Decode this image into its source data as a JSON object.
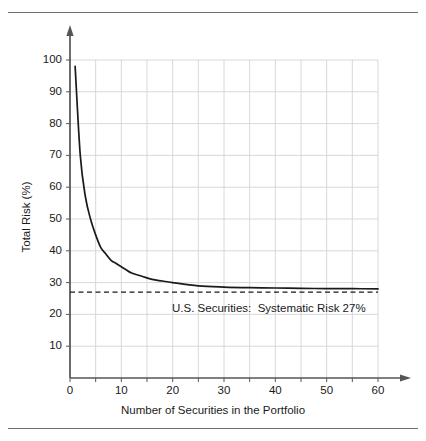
{
  "chart_data": {
    "type": "line",
    "title": "",
    "xlabel": "Number of Securities in the Portfolio",
    "ylabel": "Total Risk (%)",
    "xlim": [
      0,
      60
    ],
    "ylim": [
      0,
      100
    ],
    "xticks": [
      0,
      10,
      20,
      30,
      40,
      50,
      60
    ],
    "yticks": [
      10,
      20,
      30,
      40,
      50,
      60,
      70,
      80,
      90,
      100
    ],
    "grid": true,
    "grid_minor_step_x": 5,
    "grid_minor_step_y": 10,
    "legend": "none",
    "series": [
      {
        "name": "Total Risk",
        "x": [
          1,
          2,
          3,
          4,
          5,
          6,
          7,
          8,
          9,
          10,
          12,
          14,
          16,
          18,
          20,
          25,
          30,
          35,
          40,
          45,
          50,
          55,
          60
        ],
        "values": [
          98,
          70,
          57,
          50,
          45,
          41,
          39,
          37,
          36,
          35,
          33,
          32,
          31,
          30.5,
          30,
          29,
          28.6,
          28.4,
          28.3,
          28.2,
          28.1,
          28.1,
          28
        ]
      }
    ],
    "reference_line": {
      "name": "Systematic Risk",
      "value": 27,
      "style": "dashed",
      "orientation": "horizontal"
    },
    "annotations": [
      {
        "name": "systematic-risk-label",
        "text": "U.S. Securities:  Systematic Risk 27%",
        "x": 23,
        "y": 23
      }
    ],
    "colors": {
      "curve": "#1a1a1a",
      "grid": "#d4d4d4",
      "axis": "#555555",
      "reference_line": "#1a1a1a",
      "text": "#1a1a1a",
      "rule": "#6f6f6f"
    }
  },
  "axes": {
    "x_title": "Number of Securities in the Portfolio",
    "y_title": "Total Risk (%)",
    "x_tick_labels": [
      "0",
      "10",
      "20",
      "30",
      "40",
      "50",
      "60"
    ],
    "y_tick_labels": [
      "10",
      "20",
      "30",
      "40",
      "50",
      "60",
      "70",
      "80",
      "90",
      "100"
    ]
  },
  "annotation": {
    "text": "U.S. Securities:  Systematic Risk 27%"
  }
}
